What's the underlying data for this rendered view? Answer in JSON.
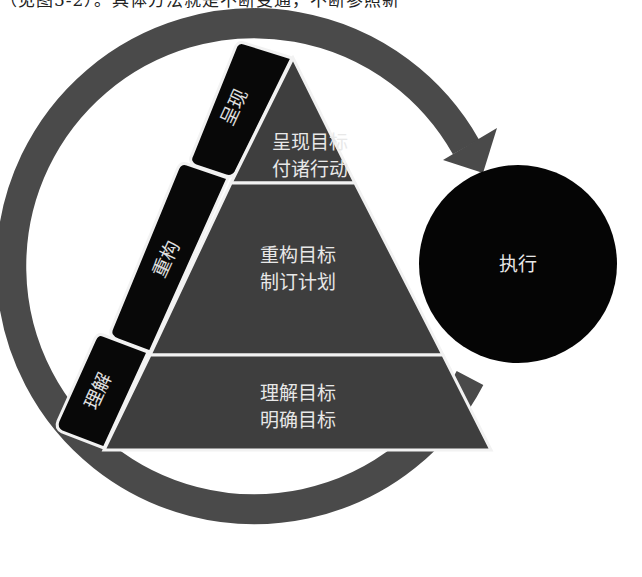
{
  "header": {
    "cutoff_text": "（见图5-2）。具体方法就是不断变通，不断参照新"
  },
  "diagram": {
    "colors": {
      "ring": "#4a4a4a",
      "pyramid": "#3e3e3e",
      "tab": "#080808",
      "execute_circle": "#050505",
      "seam": "#f2f2f2",
      "text": "#e8e8e8"
    },
    "pyramid_levels": [
      {
        "line1": "呈现目标",
        "line2": "付诸行动"
      },
      {
        "line1": "重构目标",
        "line2": "制订计划"
      },
      {
        "line1": "理解目标",
        "line2": "明确目标"
      }
    ],
    "side_tabs": [
      {
        "label": "呈现"
      },
      {
        "label": "重构"
      },
      {
        "label": "理解"
      }
    ],
    "execute": {
      "label": "执行"
    },
    "cycle_arrow": {
      "direction": "clockwise"
    }
  }
}
